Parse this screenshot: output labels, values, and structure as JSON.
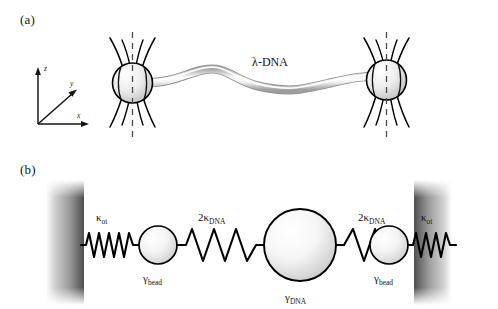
{
  "figure": {
    "panels": [
      {
        "id": "a",
        "label": "(a)",
        "caption_text": "",
        "axes": {
          "x_label": "x",
          "y_label": "y",
          "z_label": "z"
        },
        "molecule_label": "λ-DNA",
        "traps": [
          {
            "name": "left-optical-trap",
            "beam_shape": "hourglass"
          },
          {
            "name": "right-optical-trap",
            "beam_shape": "hourglass"
          }
        ],
        "beads": [
          {
            "name": "left-trapped-bead"
          },
          {
            "name": "right-trapped-bead"
          }
        ]
      },
      {
        "id": "b",
        "label": "(b)",
        "springs": [
          {
            "name": "left-trap-spring",
            "label": "κ",
            "sublabel": "ot",
            "prefix": ""
          },
          {
            "name": "left-dna-spring",
            "label": "κ",
            "sublabel": "DNA",
            "prefix": "2"
          },
          {
            "name": "right-dna-spring",
            "label": "κ",
            "sublabel": "DNA",
            "prefix": "2"
          },
          {
            "name": "right-trap-spring",
            "label": "κ",
            "sublabel": "ot",
            "prefix": ""
          }
        ],
        "masses": [
          {
            "name": "left-bead-mass",
            "label": "γ",
            "sublabel": "bead"
          },
          {
            "name": "dna-mass",
            "label": "γ",
            "sublabel": "DNA"
          },
          {
            "name": "right-bead-mass",
            "label": "γ",
            "sublabel": "bead"
          }
        ],
        "walls": [
          {
            "name": "left-wall"
          },
          {
            "name": "right-wall"
          }
        ]
      }
    ],
    "colors": {
      "ink": "#141414",
      "stroke": "#000000",
      "dna_edge": "#9a9a9a",
      "dna_core": "#ffffff",
      "bead_fill_light": "#fdfdfd",
      "bead_fill_dark": "#bdbdbd",
      "wall_dark": "#555555",
      "background": "#ffffff"
    }
  }
}
